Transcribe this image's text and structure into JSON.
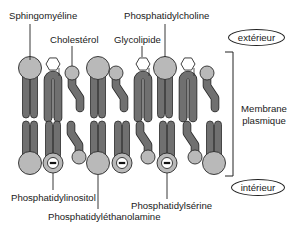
{
  "diagram": {
    "title": "Membrane plasmique",
    "side_label_line1": "Membrane",
    "side_label_line2": "plasmique",
    "outside_label": "extérieur",
    "inside_label": "intérieur",
    "top_labels": {
      "sphingomyeline": "Sphingomyéline",
      "cholesterol": "Cholestérol",
      "glycolipide": "Glycolipide",
      "phosphatidylcholine": "Phosphatidylcholine"
    },
    "bottom_labels": {
      "phosphatidylinositol": "Phosphatidylinositol",
      "phosphatidylethanolamine": "Phosphatidyléthanolamine",
      "phosphatidylserine": "Phosphatidylsérine"
    },
    "colors": {
      "head_fill": "#b9b9b9",
      "tail_fill": "#707070",
      "outline": "#2a2a2a",
      "text": "#1a1a1a"
    },
    "outer_leaflet": [
      {
        "type": "big-head",
        "x": 30
      },
      {
        "type": "hexagon-hairpin",
        "x": 53
      },
      {
        "type": "small-kinked",
        "x": 72
      },
      {
        "type": "big-head",
        "x": 98
      },
      {
        "type": "small-kinked",
        "x": 116
      },
      {
        "type": "hexagon-hairpin",
        "x": 143
      },
      {
        "type": "big-head",
        "x": 165
      },
      {
        "type": "hexagon-hairpin",
        "x": 188
      },
      {
        "type": "small-kinked",
        "x": 207
      }
    ],
    "inner_leaflet": [
      {
        "type": "big-head",
        "x": 30
      },
      {
        "type": "minus-head",
        "x": 53
      },
      {
        "type": "small-kinked",
        "x": 79
      },
      {
        "type": "big-head",
        "x": 98
      },
      {
        "type": "minus-head",
        "x": 122
      },
      {
        "type": "small-kinked",
        "x": 148
      },
      {
        "type": "minus-head",
        "x": 167
      },
      {
        "type": "small-kinked",
        "x": 195
      },
      {
        "type": "big-head",
        "x": 214
      }
    ],
    "charge_symbol": "−"
  }
}
